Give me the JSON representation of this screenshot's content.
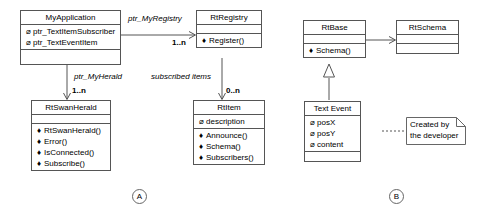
{
  "diagram": {
    "type": "uml-class-diagram",
    "background": "#ffffff",
    "line_color": "#555555",
    "figures": [
      {
        "id": "A",
        "label": "A"
      },
      {
        "id": "B",
        "label": "B"
      }
    ],
    "classes": [
      {
        "id": "my-application",
        "name": "MyApplication",
        "attributes": [
          {
            "marker": "attribute-marker",
            "label": "ptr_TextItemSubscriber"
          },
          {
            "marker": "attribute-marker",
            "label": "ptr_TextEventItem"
          }
        ],
        "methods": []
      },
      {
        "id": "rt-registry",
        "name": "RtRegistry",
        "attributes": [],
        "methods": [
          {
            "marker": "method-marker",
            "label": "Register()"
          }
        ]
      },
      {
        "id": "rt-swan-herald",
        "name": "RtSwanHerald",
        "attributes": [],
        "methods": [
          {
            "marker": "method-marker",
            "label": "RtSwanHerald()"
          },
          {
            "marker": "method-marker",
            "label": "Error()"
          },
          {
            "marker": "method-marker",
            "label": "IsConnected()"
          },
          {
            "marker": "method-marker",
            "label": "Subscribe()"
          }
        ]
      },
      {
        "id": "rt-item",
        "name": "RtItem",
        "attributes": [
          {
            "marker": "attribute-marker",
            "label": "description"
          }
        ],
        "methods": [
          {
            "marker": "method-marker",
            "label": "Announce()"
          },
          {
            "marker": "method-marker",
            "label": "Schema()"
          },
          {
            "marker": "method-marker",
            "label": "Subscribers()"
          }
        ]
      },
      {
        "id": "rt-base",
        "name": "RtBase",
        "attributes": [],
        "methods": [
          {
            "marker": "method-marker",
            "label": "Schema()"
          }
        ]
      },
      {
        "id": "rt-schema",
        "name": "RtSchema",
        "attributes": [],
        "methods": []
      },
      {
        "id": "text-event",
        "name": "Text Event",
        "attributes": [
          {
            "marker": "attribute-marker",
            "label": "posX"
          },
          {
            "marker": "attribute-marker",
            "label": "posY"
          },
          {
            "marker": "attribute-marker",
            "label": "content"
          }
        ],
        "methods": []
      }
    ],
    "associations": [
      {
        "id": "app-to-registry",
        "role": "ptr_MyRegistry",
        "multiplicity": "1..n"
      },
      {
        "id": "app-to-herald",
        "role": "ptr_MyHerald",
        "multiplicity": "1..n"
      },
      {
        "id": "registry-to-item",
        "role": "subscribed items",
        "multiplicity": "0..n"
      },
      {
        "id": "base-to-schema",
        "role": "",
        "multiplicity": ""
      },
      {
        "id": "textevent-to-base",
        "role": "",
        "multiplicity": ""
      }
    ],
    "note": {
      "id": "developer-note",
      "lines": [
        "Created by",
        "the developer"
      ]
    },
    "glyphs": {
      "attribute_marker": "⌀",
      "method_marker": "♦"
    }
  }
}
